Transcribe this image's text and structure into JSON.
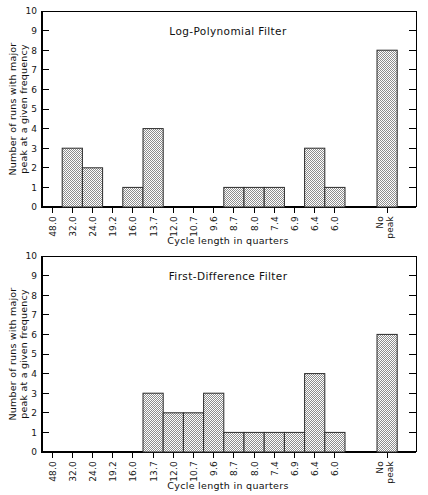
{
  "figure": {
    "background": "#ffffff",
    "ink_color": "#000000",
    "bar_edge_color": "#2b2b2b",
    "bar_fill_description": "fine black-and-white checkerboard dither"
  },
  "chart_data": [
    {
      "type": "bar",
      "title": "Log-Polynomial Filter",
      "xlabel": "Cycle length in quarters",
      "ylabel": "Number of runs with major peak at a given frequency",
      "ylabel_line1": "Number of runs with major",
      "ylabel_line2": "peak at a given frequency",
      "categories": [
        "48.0",
        "32.0",
        "24.0",
        "19.2",
        "16.0",
        "13.7",
        "12.0",
        "10.7",
        "9.6",
        "8.7",
        "8.0",
        "7.4",
        "6.9",
        "6.4",
        "6.0",
        "No peak"
      ],
      "values": [
        0,
        3,
        2,
        0,
        1,
        4,
        0,
        0,
        0,
        1,
        1,
        1,
        0,
        3,
        1,
        8
      ],
      "ylim": [
        0,
        10
      ],
      "ytick_labels": [
        "0",
        "1",
        "2",
        "3",
        "4",
        "5",
        "6",
        "7",
        "8",
        "9",
        "10"
      ],
      "ytick_step": 1,
      "grid": false,
      "legend": "none",
      "no_peak_label_line1": "No",
      "no_peak_label_line2": "peak"
    },
    {
      "type": "bar",
      "title": "First-Difference Filter",
      "xlabel": "Cycle length in quarters",
      "ylabel": "Number of runs with major peak at a given frequency",
      "ylabel_line1": "Number of runs with major",
      "ylabel_line2": "peak at a given frequency",
      "categories": [
        "48.0",
        "32.0",
        "24.0",
        "19.2",
        "16.0",
        "13.7",
        "12.0",
        "10.7",
        "9.6",
        "8.7",
        "8.0",
        "7.4",
        "6.9",
        "6.4",
        "6.0",
        "No peak"
      ],
      "values": [
        0,
        0,
        0,
        0,
        0,
        3,
        2,
        2,
        3,
        1,
        1,
        1,
        1,
        4,
        1,
        6
      ],
      "ylim": [
        0,
        10
      ],
      "ytick_labels": [
        "0",
        "1",
        "2",
        "3",
        "4",
        "5",
        "6",
        "7",
        "8",
        "9",
        "10"
      ],
      "ytick_step": 1,
      "grid": false,
      "legend": "none",
      "no_peak_label_line1": "No",
      "no_peak_label_line2": "peak"
    }
  ]
}
